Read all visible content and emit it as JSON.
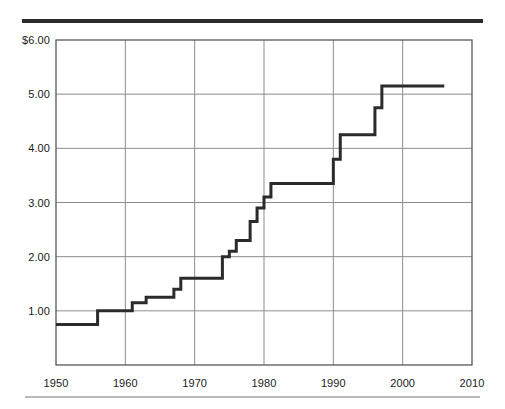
{
  "chart_data": {
    "type": "line",
    "subtype": "step",
    "title": "",
    "subtitle": "",
    "xlabel": "",
    "ylabel": "",
    "xlim": [
      1950,
      2010
    ],
    "ylim": [
      0,
      6
    ],
    "grid": true,
    "legend": null,
    "y_tick_labels": [
      "$6.00",
      "5.00",
      "4.00",
      "3.00",
      "2.00",
      "1.00"
    ],
    "y_tick_values": [
      6,
      5,
      4,
      3,
      2,
      1
    ],
    "x_tick_labels": [
      "1950",
      "1960",
      "1970",
      "1980",
      "1990",
      "2000",
      "2010"
    ],
    "x_tick_values": [
      1950,
      1960,
      1970,
      1980,
      1990,
      2000,
      2010
    ],
    "series": [
      {
        "name": "Minimum wage",
        "color": "#2b2b2b",
        "step_points": [
          {
            "x": 1950,
            "y": 0.75
          },
          {
            "x": 1956,
            "y": 1.0
          },
          {
            "x": 1961,
            "y": 1.15
          },
          {
            "x": 1963,
            "y": 1.25
          },
          {
            "x": 1967,
            "y": 1.4
          },
          {
            "x": 1968,
            "y": 1.6
          },
          {
            "x": 1974,
            "y": 2.0
          },
          {
            "x": 1975,
            "y": 2.1
          },
          {
            "x": 1976,
            "y": 2.3
          },
          {
            "x": 1978,
            "y": 2.65
          },
          {
            "x": 1979,
            "y": 2.9
          },
          {
            "x": 1980,
            "y": 3.1
          },
          {
            "x": 1981,
            "y": 3.35
          },
          {
            "x": 1990,
            "y": 3.8
          },
          {
            "x": 1991,
            "y": 4.25
          },
          {
            "x": 1996,
            "y": 4.75
          },
          {
            "x": 1997,
            "y": 5.15
          },
          {
            "x": 2006,
            "y": 5.15
          }
        ]
      }
    ]
  },
  "accents": {
    "line_color": "#2b2b2b",
    "grid_color": "#8c8c8c",
    "axis_color": "#4a4a4a",
    "rule_top_color": "#2b2b2b",
    "rule_bottom_color": "#b9b9b9",
    "background": "#ffffff"
  }
}
